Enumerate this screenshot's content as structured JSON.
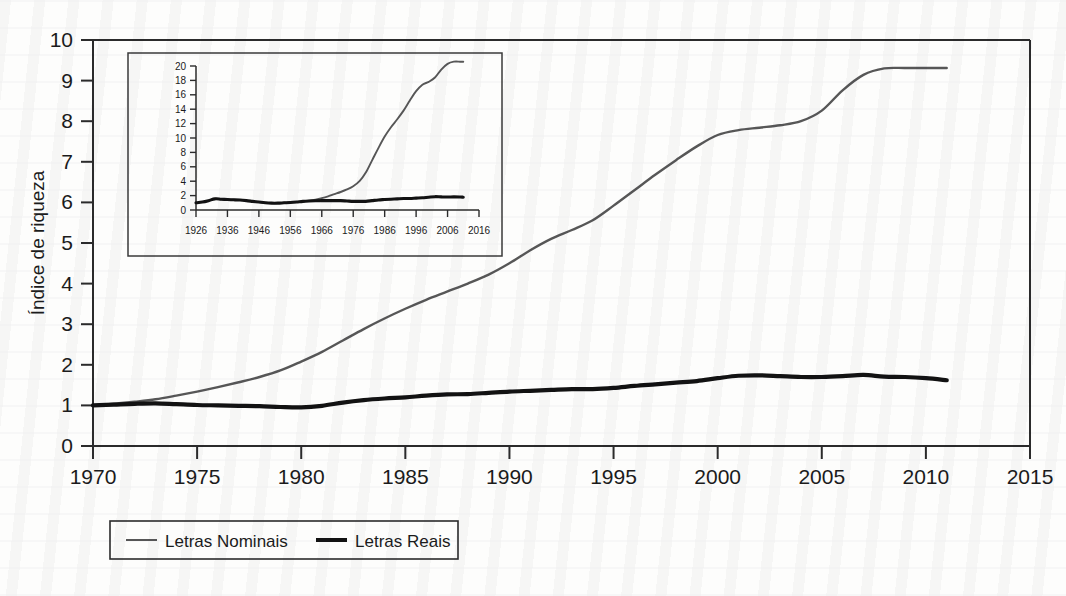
{
  "figure": {
    "background_color": "#fdfdfc",
    "axis_color": "#2b2b2b",
    "series_colors": {
      "nominais": "#575757",
      "reais": "#121212"
    }
  },
  "main_axis": {
    "ylabel": "Índice de riqueza",
    "xlabel": "",
    "y_ticks": [
      "0",
      "1",
      "2",
      "3",
      "4",
      "5",
      "6",
      "7",
      "8",
      "9",
      "10"
    ],
    "x_ticks": [
      "1970",
      "1975",
      "1980",
      "1985",
      "1990",
      "1995",
      "2000",
      "2005",
      "2010",
      "2015"
    ]
  },
  "inset_axis": {
    "y_ticks": [
      "0",
      "2",
      "4",
      "6",
      "8",
      "10",
      "12",
      "14",
      "16",
      "18",
      "20"
    ],
    "x_ticks": [
      "1926",
      "1936",
      "1946",
      "1956",
      "1966",
      "1976",
      "1986",
      "1996",
      "2006",
      "2016"
    ]
  },
  "legend": {
    "items": [
      {
        "label": "Letras Nominais",
        "color": "#575757",
        "width": 2
      },
      {
        "label": "Letras Reais",
        "color": "#121212",
        "width": 4
      }
    ]
  },
  "chart_data": {
    "type": "line",
    "title": "",
    "xlabel": "",
    "ylabel": "Índice de riqueza",
    "xlim": [
      1970,
      2015
    ],
    "ylim": [
      0,
      10
    ],
    "grid": false,
    "legend_position": "bottom",
    "x_ticks": [
      1970,
      1975,
      1980,
      1985,
      1990,
      1995,
      2000,
      2005,
      2010,
      2015
    ],
    "y_ticks": [
      0,
      1,
      2,
      3,
      4,
      5,
      6,
      7,
      8,
      9,
      10
    ],
    "series": [
      {
        "name": "Letras Nominais",
        "color": "#575757",
        "x": [
          1970,
          1971,
          1972,
          1973,
          1974,
          1975,
          1976,
          1977,
          1978,
          1979,
          1980,
          1981,
          1982,
          1983,
          1984,
          1985,
          1986,
          1987,
          1988,
          1989,
          1990,
          1991,
          1992,
          1993,
          1994,
          1995,
          1996,
          1997,
          1998,
          1999,
          2000,
          2001,
          2002,
          2003,
          2004,
          2005,
          2006,
          2007,
          2008,
          2009,
          2010,
          2011
        ],
        "values": [
          1.0,
          1.04,
          1.09,
          1.15,
          1.24,
          1.34,
          1.45,
          1.57,
          1.7,
          1.86,
          2.08,
          2.32,
          2.6,
          2.88,
          3.14,
          3.38,
          3.6,
          3.8,
          4.0,
          4.22,
          4.5,
          4.82,
          5.1,
          5.32,
          5.56,
          5.92,
          6.3,
          6.68,
          7.04,
          7.38,
          7.66,
          7.78,
          7.84,
          7.9,
          8.0,
          8.26,
          8.76,
          9.14,
          9.3,
          9.31,
          9.31,
          9.31
        ]
      },
      {
        "name": "Letras Reais",
        "color": "#121212",
        "x": [
          1970,
          1971,
          1972,
          1973,
          1974,
          1975,
          1976,
          1977,
          1978,
          1979,
          1980,
          1981,
          1982,
          1983,
          1984,
          1985,
          1986,
          1987,
          1988,
          1989,
          1990,
          1991,
          1992,
          1993,
          1994,
          1995,
          1996,
          1997,
          1998,
          1999,
          2000,
          2001,
          2002,
          2003,
          2004,
          2005,
          2006,
          2007,
          2008,
          2009,
          2010,
          2011
        ],
        "values": [
          1.0,
          1.02,
          1.04,
          1.05,
          1.03,
          1.01,
          1.0,
          0.99,
          0.98,
          0.96,
          0.95,
          0.99,
          1.07,
          1.13,
          1.17,
          1.2,
          1.24,
          1.27,
          1.28,
          1.31,
          1.34,
          1.36,
          1.38,
          1.4,
          1.4,
          1.43,
          1.48,
          1.52,
          1.56,
          1.6,
          1.67,
          1.73,
          1.74,
          1.72,
          1.7,
          1.7,
          1.72,
          1.75,
          1.71,
          1.7,
          1.67,
          1.62
        ]
      }
    ],
    "inset": {
      "type": "line",
      "xlim": [
        1926,
        2016
      ],
      "ylim": [
        0,
        20
      ],
      "x_ticks": [
        1926,
        1936,
        1946,
        1956,
        1966,
        1976,
        1986,
        1996,
        2006,
        2016
      ],
      "y_ticks": [
        0,
        2,
        4,
        6,
        8,
        10,
        12,
        14,
        16,
        18,
        20
      ],
      "series": [
        {
          "name": "Letras Nominais",
          "color": "#575757",
          "x": [
            1926,
            1928,
            1930,
            1932,
            1934,
            1936,
            1938,
            1940,
            1942,
            1944,
            1946,
            1948,
            1950,
            1952,
            1954,
            1956,
            1958,
            1960,
            1962,
            1964,
            1966,
            1968,
            1970,
            1972,
            1974,
            1976,
            1978,
            1980,
            1982,
            1984,
            1986,
            1988,
            1990,
            1992,
            1994,
            1996,
            1998,
            2000,
            2002,
            2004,
            2006,
            2008,
            2010,
            2011
          ],
          "values": [
            1.0,
            1.1,
            1.3,
            1.55,
            1.5,
            1.45,
            1.42,
            1.38,
            1.3,
            1.2,
            1.1,
            1.0,
            0.95,
            0.95,
            1.0,
            1.05,
            1.12,
            1.2,
            1.3,
            1.45,
            1.65,
            1.9,
            2.2,
            2.5,
            2.85,
            3.3,
            4.0,
            5.2,
            6.9,
            8.6,
            10.2,
            11.5,
            12.6,
            13.8,
            15.2,
            16.5,
            17.4,
            17.8,
            18.4,
            19.5,
            20.3,
            20.6,
            20.6,
            20.6
          ]
        },
        {
          "name": "Letras Reais",
          "color": "#121212",
          "x": [
            1926,
            1928,
            1930,
            1932,
            1934,
            1936,
            1938,
            1940,
            1942,
            1944,
            1946,
            1948,
            1950,
            1952,
            1954,
            1956,
            1958,
            1960,
            1962,
            1964,
            1966,
            1968,
            1970,
            1972,
            1974,
            1976,
            1978,
            1980,
            1982,
            1984,
            1986,
            1988,
            1990,
            1992,
            1994,
            1996,
            1998,
            2000,
            2002,
            2004,
            2006,
            2008,
            2010,
            2011
          ],
          "values": [
            1.0,
            1.1,
            1.3,
            1.55,
            1.5,
            1.45,
            1.42,
            1.38,
            1.3,
            1.2,
            1.1,
            1.0,
            0.95,
            0.95,
            1.0,
            1.05,
            1.12,
            1.2,
            1.25,
            1.28,
            1.3,
            1.3,
            1.3,
            1.3,
            1.25,
            1.2,
            1.2,
            1.2,
            1.3,
            1.4,
            1.45,
            1.5,
            1.55,
            1.6,
            1.6,
            1.65,
            1.7,
            1.78,
            1.85,
            1.82,
            1.8,
            1.82,
            1.8,
            1.78
          ]
        }
      ]
    }
  }
}
